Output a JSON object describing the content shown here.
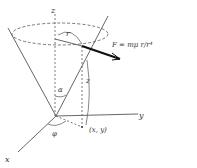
{
  "diagram": {
    "axes": {
      "x": "x",
      "y": "y",
      "z": "z"
    },
    "angles": {
      "alpha": "α",
      "phi": "φ"
    },
    "vectors": {
      "r": "r",
      "z_height": "z"
    },
    "point_label": "(x, y)",
    "force_equation": "F = mμ r/r⁴",
    "colors": {
      "stroke": "#333333",
      "background": "#ffffff"
    }
  }
}
